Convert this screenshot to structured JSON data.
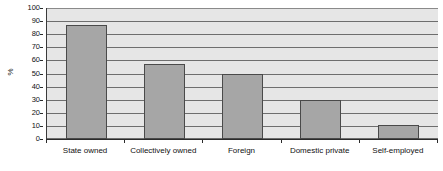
{
  "chart_data": {
    "type": "bar",
    "title": "",
    "subtitle": "",
    "xlabel": "",
    "ylabel": "%",
    "categories": [
      "State owned",
      "Collectively owned",
      "Foreign",
      "Domestic private",
      "Self-employed"
    ],
    "values": [
      87,
      57,
      50,
      30,
      11
    ],
    "series": [
      {
        "name": "",
        "values": [
          87,
          57,
          50,
          30,
          11
        ]
      }
    ],
    "ylim": [
      0,
      100
    ],
    "y_ticks": [
      0,
      10,
      20,
      30,
      40,
      50,
      60,
      70,
      80,
      90,
      100
    ],
    "y_tick_labels": [
      "0",
      "10",
      "20",
      "30",
      "40",
      "50",
      "60",
      "70",
      "80",
      "90",
      "100"
    ],
    "grid": true,
    "grid_axis": "y",
    "legend": false,
    "legend_position": "none",
    "annotations": [],
    "colors": {
      "bar_fill": "#a6a6a6",
      "bar_border": "#4a4a4a",
      "plot_background": "#e6e6e6",
      "grid_line": "#6e6e6e",
      "axis_line": "#2b2b2b",
      "figure_background": "#ffffff",
      "text": "#111111"
    }
  }
}
